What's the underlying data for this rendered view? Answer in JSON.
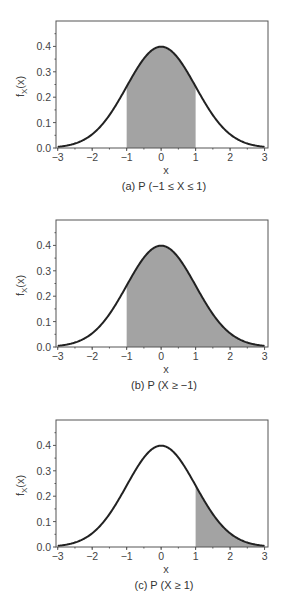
{
  "chart_data": [
    {
      "type": "area",
      "title": "(a) P (−1 ≤ X ≤ 1)",
      "xlabel": "x",
      "ylabel": "f_X(x)",
      "xlim": [
        -3.05,
        3.1
      ],
      "ylim": [
        0,
        0.5
      ],
      "xticks": [
        -3,
        -2,
        -1,
        0,
        1,
        2,
        3
      ],
      "xtick_labels": [
        "−3",
        "−2",
        "−1",
        "0",
        "1",
        "2",
        "3"
      ],
      "yticks": [
        0.0,
        0.1,
        0.2,
        0.3,
        0.4
      ],
      "ytick_labels": [
        "0.0",
        "0.1",
        "0.2",
        "0.3",
        "0.4"
      ],
      "curve": "standard normal pdf",
      "x": [
        -3,
        -2.5,
        -2,
        -1.5,
        -1,
        -0.5,
        0,
        0.5,
        1,
        1.5,
        2,
        2.5,
        3
      ],
      "y": [
        0.0044,
        0.0175,
        0.054,
        0.1295,
        0.242,
        0.3521,
        0.3989,
        0.3521,
        0.242,
        0.1295,
        0.054,
        0.0175,
        0.0044
      ],
      "shaded_region": [
        -1,
        1
      ],
      "grid": false
    },
    {
      "type": "area",
      "title": "(b) P (X ≥ −1)",
      "xlabel": "x",
      "ylabel": "f_X(x)",
      "xlim": [
        -3.05,
        3.1
      ],
      "ylim": [
        0,
        0.5
      ],
      "xticks": [
        -3,
        -2,
        -1,
        0,
        1,
        2,
        3
      ],
      "xtick_labels": [
        "−3",
        "−2",
        "−1",
        "0",
        "1",
        "2",
        "3"
      ],
      "yticks": [
        0.0,
        0.1,
        0.2,
        0.3,
        0.4
      ],
      "ytick_labels": [
        "0.0",
        "0.1",
        "0.2",
        "0.3",
        "0.4"
      ],
      "curve": "standard normal pdf",
      "x": [
        -3,
        -2.5,
        -2,
        -1.5,
        -1,
        -0.5,
        0,
        0.5,
        1,
        1.5,
        2,
        2.5,
        3
      ],
      "y": [
        0.0044,
        0.0175,
        0.054,
        0.1295,
        0.242,
        0.3521,
        0.3989,
        0.3521,
        0.242,
        0.1295,
        0.054,
        0.0175,
        0.0044
      ],
      "shaded_region": [
        -1,
        3
      ],
      "grid": false
    },
    {
      "type": "area",
      "title": "(c) P (X ≥ 1)",
      "xlabel": "x",
      "ylabel": "f_X(x)",
      "xlim": [
        -3.05,
        3.1
      ],
      "ylim": [
        0,
        0.5
      ],
      "xticks": [
        -3,
        -2,
        -1,
        0,
        1,
        2,
        3
      ],
      "xtick_labels": [
        "−3",
        "−2",
        "−1",
        "0",
        "1",
        "2",
        "3"
      ],
      "yticks": [
        0.0,
        0.1,
        0.2,
        0.3,
        0.4
      ],
      "ytick_labels": [
        "0.0",
        "0.1",
        "0.2",
        "0.3",
        "0.4"
      ],
      "curve": "standard normal pdf",
      "x": [
        -3,
        -2.5,
        -2,
        -1.5,
        -1,
        -0.5,
        0,
        0.5,
        1,
        1.5,
        2,
        2.5,
        3
      ],
      "y": [
        0.0044,
        0.0175,
        0.054,
        0.1295,
        0.242,
        0.3521,
        0.3989,
        0.3521,
        0.242,
        0.1295,
        0.054,
        0.0175,
        0.0044
      ],
      "shaded_region": [
        1,
        3
      ],
      "grid": false
    }
  ],
  "style": {
    "curve_color": "#222222",
    "fill_color": "#a3a3a3",
    "axis_color": "#555555"
  },
  "panels": [
    {
      "caption": "(a) P (−1 ≤ X ≤ 1)",
      "xlabel": "x",
      "ylabel_main": "f",
      "ylabel_sub": "X",
      "ylabel_tail": "(x)"
    },
    {
      "caption": "(b) P (X ≥ −1)",
      "xlabel": "x",
      "ylabel_main": "f",
      "ylabel_sub": "X",
      "ylabel_tail": "(x)"
    },
    {
      "caption": "(c) P (X ≥ 1)",
      "xlabel": "x",
      "ylabel_main": "f",
      "ylabel_sub": "X",
      "ylabel_tail": "(x)"
    }
  ],
  "ticks": {
    "x": [
      "−3",
      "−2",
      "−1",
      "0",
      "1",
      "2",
      "3"
    ],
    "y": [
      "0.0",
      "0.1",
      "0.2",
      "0.3",
      "0.4"
    ]
  }
}
